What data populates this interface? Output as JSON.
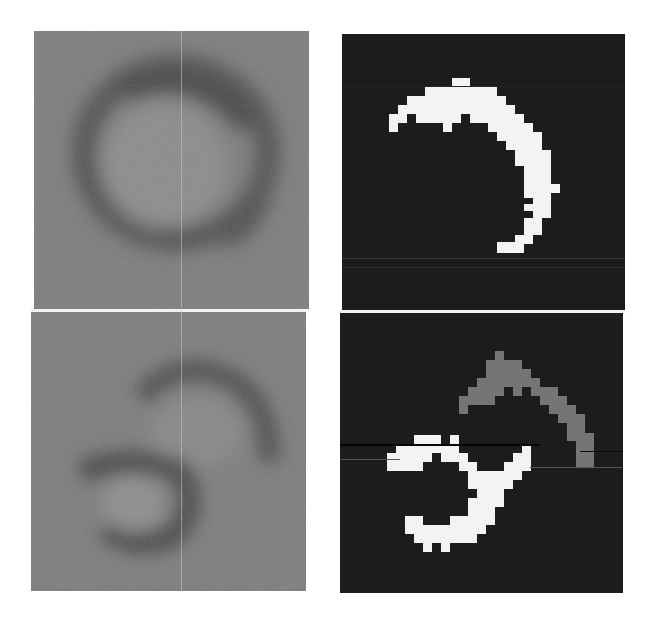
{
  "figure": {
    "layout": {
      "rows": 2,
      "cols": 2
    },
    "colors": {
      "background": "#ffffff",
      "grayscale_panel_base": "#7b7b7b",
      "ring_dark": "#4d4d4d",
      "ring_inner": "#888888",
      "mask_background": "#1c1c1c",
      "mask_foreground_primary": "#f3f3f3",
      "mask_foreground_secondary": "#757575",
      "separator": "#f2f2f2"
    },
    "panels": [
      {
        "id": "top-left",
        "type": "grayscale",
        "content": "single dark ring, circular structure"
      },
      {
        "id": "top-right",
        "type": "mask",
        "content": "white crescent segmentation"
      },
      {
        "id": "bottom-left",
        "type": "grayscale",
        "content": "two overlapping dark rings"
      },
      {
        "id": "bottom-right",
        "type": "mask",
        "content": "gray upper crescent and white lower crescent segmentation"
      }
    ]
  }
}
